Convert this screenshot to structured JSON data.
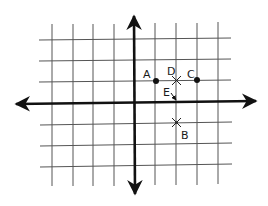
{
  "diagram": {
    "type": "coordinate-grid",
    "grid": {
      "x_range": [
        -5,
        4
      ],
      "y_range": [
        -3,
        3
      ],
      "cell_px": 20.7,
      "origin_px": [
        134,
        103
      ],
      "line_color": "#555555",
      "axis_color": "#111111"
    },
    "points": [
      {
        "label": "A",
        "x": 1,
        "y": 1,
        "marker": "dot"
      },
      {
        "label": "D",
        "x": 2,
        "y": 1,
        "marker": "cross"
      },
      {
        "label": "C",
        "x": 3,
        "y": 1,
        "marker": "dot"
      },
      {
        "label": "E",
        "x": 2,
        "y": 0,
        "marker": "arrow"
      },
      {
        "label": "B",
        "x": 2,
        "y": -1,
        "marker": "cross"
      }
    ],
    "labels": {
      "A": "A",
      "B": "B",
      "C": "C",
      "D": "D",
      "E": "E"
    }
  }
}
